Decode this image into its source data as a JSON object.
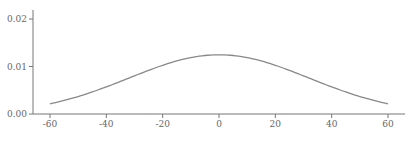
{
  "chart_data": {
    "type": "line",
    "title": "",
    "xlabel": "",
    "ylabel": "",
    "xlim": [
      -65,
      65
    ],
    "ylim": [
      0,
      0.022
    ],
    "grid": false,
    "legend": null,
    "x_ticks": [
      "-60",
      "-40",
      "-20",
      "0",
      "20",
      "40",
      "60"
    ],
    "y_ticks": [
      "0.00",
      "0.01",
      "0.02"
    ],
    "series": [
      {
        "name": "normal density (mean 0, sd ~32)",
        "color": "#888888",
        "x": [
          -60,
          -50,
          -40,
          -30,
          -20,
          -10,
          0,
          10,
          20,
          30,
          40,
          50,
          60
        ],
        "y": [
          0.0021,
          0.0037,
          0.0057,
          0.008,
          0.0103,
          0.0119,
          0.0125,
          0.0119,
          0.0103,
          0.008,
          0.0057,
          0.0037,
          0.0021
        ]
      }
    ]
  }
}
